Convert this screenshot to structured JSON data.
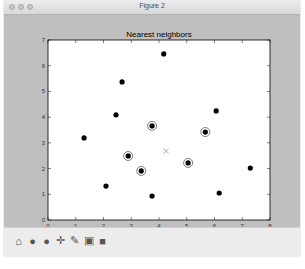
{
  "window": {
    "title": "Figure 2"
  },
  "toolbar": {
    "buttons": [
      {
        "name": "home-icon",
        "glyph": "⌂"
      },
      {
        "name": "back-icon",
        "glyph": "●"
      },
      {
        "name": "forward-icon",
        "glyph": "●"
      },
      {
        "name": "pan-icon",
        "glyph": "✛"
      },
      {
        "name": "zoom-icon",
        "glyph": "✎"
      },
      {
        "name": "subplots-icon",
        "glyph": "▣"
      },
      {
        "name": "save-icon",
        "glyph": "■"
      }
    ]
  },
  "chart_data": {
    "type": "scatter",
    "title": "Nearest neighbors",
    "xlabel": "",
    "ylabel": "",
    "xlim": [
      0,
      8
    ],
    "ylim": [
      0,
      7
    ],
    "xticks": [
      "0",
      "1",
      "2",
      "3",
      "4",
      "5",
      "6",
      "7",
      "8"
    ],
    "yticks": [
      "0",
      "1",
      "2",
      "3",
      "4",
      "5",
      "6",
      "7"
    ],
    "grid": false,
    "legend": null,
    "series": [
      {
        "name": "points",
        "marker": "filled-circle",
        "color": "#000000",
        "points": [
          {
            "x": 4.17,
            "y": 6.46,
            "neighbor": false
          },
          {
            "x": 2.67,
            "y": 5.37,
            "neighbor": false
          },
          {
            "x": 2.45,
            "y": 4.09,
            "neighbor": false
          },
          {
            "x": 3.75,
            "y": 3.66,
            "neighbor": true
          },
          {
            "x": 1.3,
            "y": 3.19,
            "neighbor": false
          },
          {
            "x": 5.67,
            "y": 3.42,
            "neighbor": true
          },
          {
            "x": 6.06,
            "y": 4.24,
            "neighbor": false
          },
          {
            "x": 2.89,
            "y": 2.49,
            "neighbor": true
          },
          {
            "x": 3.36,
            "y": 1.91,
            "neighbor": true
          },
          {
            "x": 5.05,
            "y": 2.22,
            "neighbor": true
          },
          {
            "x": 2.09,
            "y": 1.32,
            "neighbor": false
          },
          {
            "x": 3.75,
            "y": 0.93,
            "neighbor": false
          },
          {
            "x": 6.17,
            "y": 1.05,
            "neighbor": false
          },
          {
            "x": 7.29,
            "y": 2.02,
            "neighbor": false
          }
        ]
      },
      {
        "name": "query point",
        "marker": "x",
        "color": "#999999",
        "points": [
          {
            "x": 4.26,
            "y": 2.68
          }
        ]
      }
    ],
    "annotations": [
      "5 nearest neighbors highlighted with open circles around query point (x)"
    ]
  }
}
